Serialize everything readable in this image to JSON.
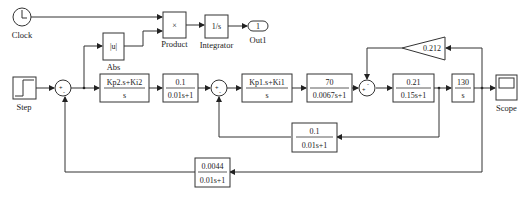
{
  "diagram": {
    "blocks": {
      "clock": {
        "label": "Clock"
      },
      "abs": {
        "text": "|u|",
        "label": "Abs"
      },
      "product": {
        "text": "×",
        "label": "Product"
      },
      "integrator": {
        "text": "1/s",
        "label": "Integrator"
      },
      "out1": {
        "text": "1",
        "label": "Out1"
      },
      "step": {
        "label": "Step"
      },
      "sum1": {
        "signs": "+-"
      },
      "pi_outer": {
        "num": "Kp2.s+Ki2",
        "den": "s"
      },
      "filter1": {
        "num": "0.1",
        "den": "0.01s+1"
      },
      "sum2": {
        "signs": "+-"
      },
      "pi_inner": {
        "num": "Kp1.s+Ki1",
        "den": "s"
      },
      "tf70": {
        "num": "70",
        "den": "0.0067s+1"
      },
      "sum3": {
        "signs": "+-"
      },
      "tf021": {
        "num": "0.21",
        "den": "0.15s+1"
      },
      "tf130": {
        "num": "130",
        "den": "s"
      },
      "gain": {
        "text": "0.212"
      },
      "scope": {
        "label": "Scope"
      },
      "fb_inner": {
        "num": "0.1",
        "den": "0.01s+1"
      },
      "fb_outer": {
        "num": "0.0044",
        "den": "0.01s+1"
      }
    }
  }
}
